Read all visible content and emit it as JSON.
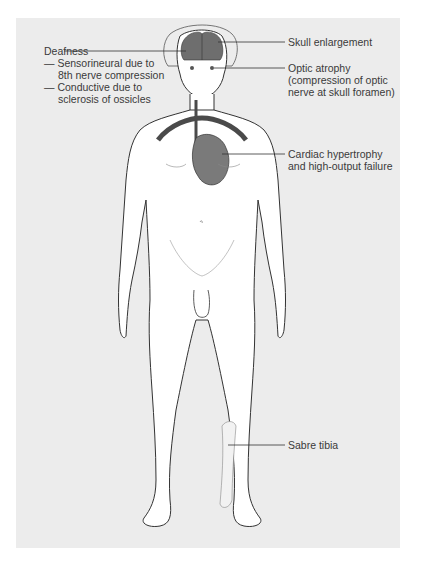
{
  "figure": {
    "background_color": "#ececec",
    "outline_color": "#333333",
    "organ_color": "#6e6e6e",
    "vessel_color": "#4a4a4a"
  },
  "labels": {
    "deafness": {
      "title": "Deafness",
      "items": [
        {
          "dash": "—",
          "line1": "Sensorineural due to",
          "line2": "8th nerve compression"
        },
        {
          "dash": "—",
          "line1": "Conductive due to",
          "line2": "sclerosis of ossicles"
        }
      ]
    },
    "skull": {
      "line1": "Skull enlargement"
    },
    "optic": {
      "line1": "Optic atrophy",
      "line2": "(compression of optic",
      "line3": "nerve at skull foramen)"
    },
    "cardiac": {
      "line1": "Cardiac hypertrophy",
      "line2": "and high-output failure"
    },
    "tibia": {
      "line1": "Sabre tibia"
    }
  }
}
